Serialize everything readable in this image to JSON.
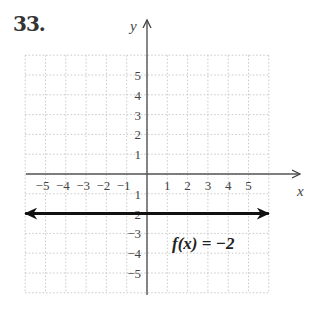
{
  "problem": {
    "number": "33."
  },
  "chart_data": {
    "type": "line",
    "title": "",
    "xlabel": "x",
    "ylabel": "y",
    "xlim": [
      -6,
      6
    ],
    "ylim": [
      -6,
      6
    ],
    "grid": true,
    "x_ticks": [
      -5,
      -4,
      -3,
      -2,
      -1,
      1,
      2,
      3,
      4,
      5
    ],
    "x_tick_labels": [
      "−5",
      "−4",
      "−3",
      "−2",
      "−1",
      "1",
      "2",
      "3",
      "4",
      "5"
    ],
    "y_ticks": [
      5,
      4,
      3,
      2,
      1,
      -1,
      -2,
      -3,
      -4,
      -5
    ],
    "y_tick_labels": [
      "5",
      "4",
      "3",
      "2",
      "1",
      "1",
      "2",
      "−3",
      "−4",
      "−5"
    ],
    "series": [
      {
        "name": "f(x) = −2",
        "x": [
          -6,
          6
        ],
        "y": [
          -2,
          -2
        ],
        "style": "bold line with arrows at both ends"
      }
    ],
    "annotations": [
      {
        "text": "f(x) = −2",
        "x": 1.5,
        "y": -3.4
      }
    ]
  },
  "labels": {
    "x_axis": "x",
    "y_axis": "y",
    "function": "f(x) = −2"
  }
}
